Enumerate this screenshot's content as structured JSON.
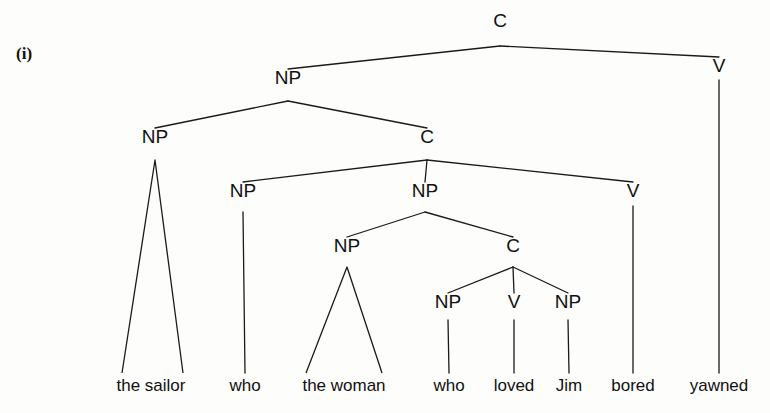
{
  "figure": {
    "example_label": "(i)",
    "sentence": "the sailor who the woman who loved Jim bored yawned",
    "ink_color": "#1a1a1a",
    "background_color": "#fdfdfc"
  },
  "nodes": {
    "root_c": {
      "label": "C",
      "x": 500,
      "y": 27,
      "apex_y": 46
    },
    "np_top": {
      "label": "NP",
      "x": 288,
      "y": 84,
      "apex_y": 101
    },
    "np_sailor": {
      "label": "NP",
      "x": 155,
      "y": 143,
      "apex_y": 160
    },
    "c_level2": {
      "label": "C",
      "x": 427,
      "y": 143,
      "apex_y": 160
    },
    "v_yawned": {
      "label": "V",
      "x": 719,
      "y": 72,
      "apex_y": 80
    },
    "np_who1": {
      "label": "NP",
      "x": 243,
      "y": 197,
      "apex_y": 212
    },
    "np_level3": {
      "label": "NP",
      "x": 425,
      "y": 197,
      "apex_y": 212
    },
    "v_bored": {
      "label": "V",
      "x": 633,
      "y": 197,
      "apex_y": 206
    },
    "np_woman": {
      "label": "NP",
      "x": 347,
      "y": 252,
      "apex_y": 267
    },
    "c_level4": {
      "label": "C",
      "x": 513,
      "y": 252,
      "apex_y": 267
    },
    "np_who2": {
      "label": "NP",
      "x": 448,
      "y": 308,
      "apex_y": 320
    },
    "v_loved": {
      "label": "V",
      "x": 514,
      "y": 308,
      "apex_y": 320
    },
    "np_jim": {
      "label": "NP",
      "x": 568,
      "y": 308,
      "apex_y": 320
    }
  },
  "leaves": [
    {
      "text": "the sailor",
      "x": 151,
      "y": 391,
      "tri_left": 122,
      "tri_right": 183
    },
    {
      "text": "who",
      "x": 245,
      "y": 391,
      "tri_left": null,
      "tri_right": null
    },
    {
      "text": "the woman",
      "x": 344,
      "y": 391,
      "tri_left": 306,
      "tri_right": 382
    },
    {
      "text": "who",
      "x": 449,
      "y": 391,
      "tri_left": null,
      "tri_right": null
    },
    {
      "text": "loved",
      "x": 514,
      "y": 391,
      "tri_left": null,
      "tri_right": null
    },
    {
      "text": "Jim",
      "x": 569,
      "y": 391,
      "tri_left": null,
      "tri_right": null
    },
    {
      "text": "bored",
      "x": 633,
      "y": 391,
      "tri_left": null,
      "tri_right": null
    },
    {
      "text": "yawned",
      "x": 719,
      "y": 391,
      "tri_left": null,
      "tri_right": null
    }
  ],
  "edges": [
    {
      "from": "root_c",
      "to": "np_top",
      "kind": "branch"
    },
    {
      "from": "root_c",
      "to": "v_yawned",
      "kind": "branch"
    },
    {
      "from": "np_top",
      "to": "np_sailor",
      "kind": "branch"
    },
    {
      "from": "np_top",
      "to": "c_level2",
      "kind": "branch"
    },
    {
      "from": "c_level2",
      "to": "np_who1",
      "kind": "branch"
    },
    {
      "from": "c_level2",
      "to": "np_level3",
      "kind": "branch"
    },
    {
      "from": "c_level2",
      "to": "v_bored",
      "kind": "branch"
    },
    {
      "from": "np_level3",
      "to": "np_woman",
      "kind": "branch"
    },
    {
      "from": "np_level3",
      "to": "c_level4",
      "kind": "branch"
    },
    {
      "from": "c_level4",
      "to": "np_who2",
      "kind": "branch"
    },
    {
      "from": "c_level4",
      "to": "v_loved",
      "kind": "branch"
    },
    {
      "from": "c_level4",
      "to": "np_jim",
      "kind": "branch"
    },
    {
      "from": "np_sailor",
      "to": "leaf0",
      "kind": "triangle"
    },
    {
      "from": "np_who1",
      "to": "leaf1",
      "kind": "stem"
    },
    {
      "from": "np_woman",
      "to": "leaf2",
      "kind": "triangle"
    },
    {
      "from": "np_who2",
      "to": "leaf3",
      "kind": "stem"
    },
    {
      "from": "v_loved",
      "to": "leaf4",
      "kind": "stem"
    },
    {
      "from": "np_jim",
      "to": "leaf5",
      "kind": "stem"
    },
    {
      "from": "v_bored",
      "to": "leaf6",
      "kind": "stem"
    },
    {
      "from": "v_yawned",
      "to": "leaf7",
      "kind": "stem"
    }
  ]
}
